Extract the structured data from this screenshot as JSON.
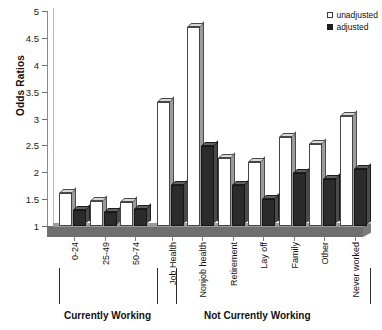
{
  "chart_data": {
    "type": "bar",
    "title": "",
    "xlabel": "",
    "ylabel": "Odds Ratios",
    "ylim": [
      1,
      5
    ],
    "ytick_labels": [
      "5",
      "4.5",
      "4",
      "3.5",
      "3",
      "2.5",
      "2",
      "1.5",
      "1"
    ],
    "ytick_values": [
      5,
      4.5,
      4,
      3.5,
      3,
      2.5,
      2,
      1.5,
      1
    ],
    "grid": false,
    "legend_position": "top-right",
    "categories": [
      "0-24",
      "25-49",
      "50-74",
      "Job Health",
      "Nonjob health",
      "Retirement",
      "Lay off",
      "Family",
      "Other",
      "Never worked"
    ],
    "series": [
      {
        "name": "unadjusted",
        "color": "#ffffff",
        "values": [
          1.62,
          1.47,
          1.44,
          3.3,
          4.7,
          2.27,
          2.19,
          2.66,
          2.53,
          3.05
        ]
      },
      {
        "name": "adjusted",
        "color": "#2b2b2b",
        "values": [
          1.3,
          1.27,
          1.32,
          1.76,
          2.48,
          1.76,
          1.5,
          1.98,
          1.87,
          2.07
        ]
      }
    ],
    "group_labels": [
      {
        "label": "Currently Working",
        "categories": [
          "0-24",
          "25-49",
          "50-74"
        ]
      },
      {
        "label": "Not Currently Working",
        "categories": [
          "Job Health",
          "Nonjob health",
          "Retirement",
          "Lay off",
          "Family",
          "Other",
          "Never worked"
        ]
      }
    ]
  },
  "legend": {
    "entries": [
      {
        "label": "unadjusted",
        "marker": "open-square-icon"
      },
      {
        "label": "adjusted",
        "marker": "filled-square-icon"
      }
    ]
  },
  "axis": {
    "y_title": "Odds Ratios"
  },
  "group_bands": {
    "left_label": "Currently Working",
    "right_label": "Not Currently Working"
  }
}
